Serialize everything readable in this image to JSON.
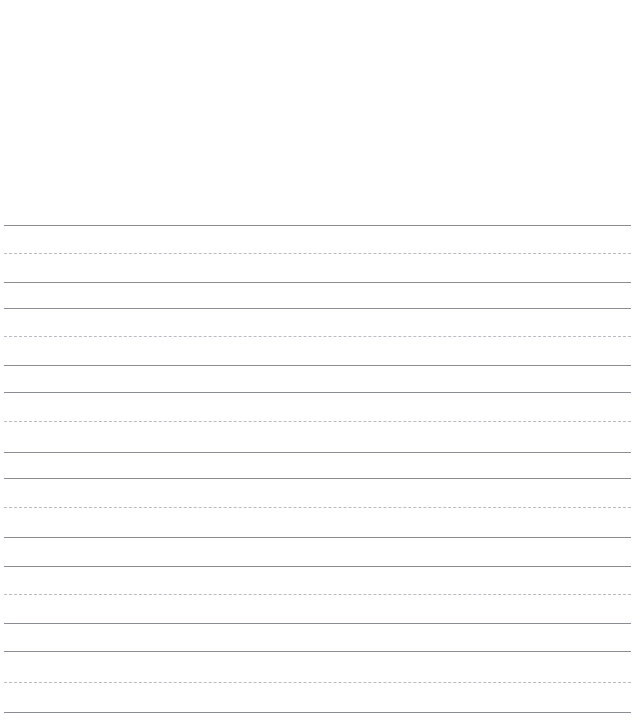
{
  "document": {
    "kind": "handwriting-practice-paper",
    "title": "Handwriting Practice Paper",
    "page_width": 639,
    "page_height": 724,
    "background_color": "#ffffff",
    "top_blank_margin_px": 218,
    "content_text": "",
    "colors": {
      "solid_rule": "#8a8d93",
      "dashed_rule": "#b9bcc2",
      "paper": "#ffffff"
    },
    "rule_geometry": {
      "left_px": 4,
      "right_px": 631,
      "line_length_px": 627,
      "solid_thickness_px": 1,
      "dashed_thickness_px": 1,
      "dash_length_px": 5,
      "dash_gap_px": 3
    },
    "group_count": 6,
    "group_pattern": [
      "solid",
      "dashed",
      "solid"
    ],
    "rules": [
      {
        "index": 0,
        "style": "solid",
        "role": "group-top",
        "group": 1,
        "y": 225
      },
      {
        "index": 1,
        "style": "dashed",
        "role": "group-midline",
        "group": 1,
        "y": 253
      },
      {
        "index": 2,
        "style": "solid",
        "role": "group-baseline",
        "group": 1,
        "y": 282
      },
      {
        "index": 3,
        "style": "solid",
        "role": "group-top",
        "group": 2,
        "y": 308
      },
      {
        "index": 4,
        "style": "dashed",
        "role": "group-midline",
        "group": 2,
        "y": 336
      },
      {
        "index": 5,
        "style": "solid",
        "role": "group-baseline",
        "group": 2,
        "y": 365
      },
      {
        "index": 6,
        "style": "solid",
        "role": "group-top",
        "group": 3,
        "y": 392
      },
      {
        "index": 7,
        "style": "dashed",
        "role": "group-midline",
        "group": 3,
        "y": 421
      },
      {
        "index": 8,
        "style": "solid",
        "role": "group-baseline",
        "group": 3,
        "y": 452
      },
      {
        "index": 9,
        "style": "solid",
        "role": "group-top",
        "group": 4,
        "y": 478
      },
      {
        "index": 10,
        "style": "dashed",
        "role": "group-midline",
        "group": 4,
        "y": 507
      },
      {
        "index": 11,
        "style": "solid",
        "role": "group-baseline",
        "group": 4,
        "y": 537
      },
      {
        "index": 12,
        "style": "solid",
        "role": "group-top",
        "group": 5,
        "y": 566
      },
      {
        "index": 13,
        "style": "dashed",
        "role": "group-midline",
        "group": 5,
        "y": 594
      },
      {
        "index": 14,
        "style": "solid",
        "role": "group-baseline",
        "group": 5,
        "y": 623
      },
      {
        "index": 15,
        "style": "solid",
        "role": "group-top",
        "group": 6,
        "y": 651
      },
      {
        "index": 16,
        "style": "dashed",
        "role": "group-midline",
        "group": 6,
        "y": 682
      },
      {
        "index": 17,
        "style": "solid",
        "role": "group-baseline",
        "group": 6,
        "y": 712
      }
    ]
  }
}
